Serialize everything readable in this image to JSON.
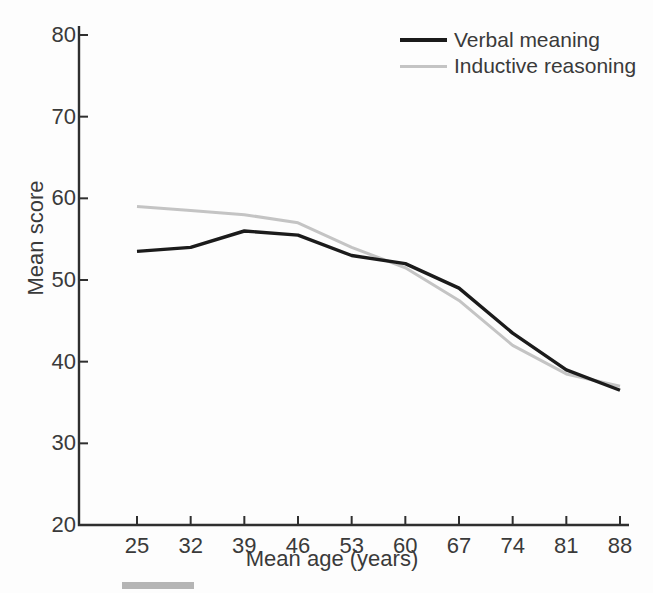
{
  "figure": {
    "background": "#fdfdfd",
    "axis_color": "#2f2f2f",
    "text_color": "#3a3a3a",
    "artifact_color": "#b5b5b5"
  },
  "chart_data": {
    "type": "line",
    "title": "",
    "xlabel": "Mean age (years)",
    "ylabel": "Mean score",
    "x": [
      25,
      32,
      39,
      46,
      53,
      60,
      67,
      74,
      81,
      88
    ],
    "x_tick_labels": [
      "25",
      "32",
      "39",
      "46",
      "53",
      "60",
      "67",
      "74",
      "81",
      "88"
    ],
    "y_ticks": [
      20,
      30,
      40,
      50,
      60,
      70,
      80
    ],
    "y_tick_labels": [
      "20",
      "30",
      "40",
      "50",
      "60",
      "70",
      "80"
    ],
    "xlim": [
      25,
      88
    ],
    "ylim": [
      20,
      80
    ],
    "grid": false,
    "legend_position": "top-right",
    "series": [
      {
        "name": "Verbal meaning",
        "color": "#1b1b1b",
        "values": [
          53.5,
          54,
          56,
          55.5,
          53,
          52,
          49,
          43.5,
          39,
          36.5
        ]
      },
      {
        "name": "Inductive reasoning",
        "color": "#c4c4c4",
        "values": [
          59,
          58.5,
          58,
          57,
          54,
          51.5,
          47.5,
          42,
          38.5,
          37
        ]
      }
    ]
  }
}
